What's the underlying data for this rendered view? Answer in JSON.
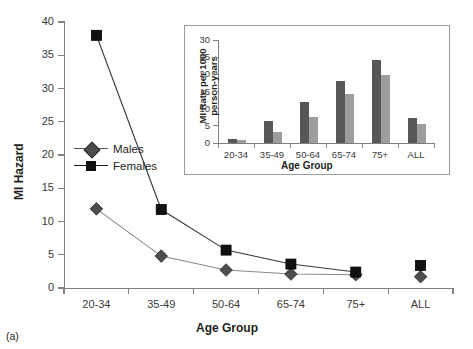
{
  "panel_label": "(a)",
  "legend": {
    "items": [
      {
        "label": "Males",
        "marker": "diamond-marker",
        "color": "#4d4d4d"
      },
      {
        "label": "Females",
        "marker": "square-marker",
        "color": "#111111"
      }
    ]
  },
  "chart_data": [
    {
      "type": "line",
      "name": "main-line-chart",
      "title": "",
      "xlabel": "Age Group",
      "ylabel": "MI Hazard",
      "categories": [
        "20-34",
        "35-49",
        "50-64",
        "65-74",
        "75+",
        "ALL"
      ],
      "yticks": [
        0,
        5,
        10,
        15,
        20,
        25,
        30,
        35,
        40
      ],
      "ylim": [
        0,
        40
      ],
      "grid": false,
      "legend_position": "inside-left",
      "note": "ALL category markers are plotted detached from the connecting line",
      "series": [
        {
          "name": "Males",
          "color": "#4d4d4d",
          "marker": "diamond",
          "values": [
            11.9,
            4.8,
            2.7,
            2.1,
            2.0,
            1.7
          ]
        },
        {
          "name": "Females",
          "color": "#111111",
          "marker": "square",
          "values": [
            38.0,
            11.8,
            5.7,
            3.6,
            2.4,
            3.4
          ]
        }
      ]
    },
    {
      "type": "bar",
      "name": "inset-bar-chart",
      "title": "",
      "xlabel": "Age Group",
      "ylabel": "MI Rate per 1000 person-years",
      "categories": [
        "20-34",
        "35-49",
        "50-64",
        "65-74",
        "75+",
        "ALL"
      ],
      "yticks": [
        0,
        5,
        10,
        15,
        20,
        25,
        30
      ],
      "ylim": [
        0,
        30
      ],
      "grid": false,
      "series": [
        {
          "name": "Males",
          "color": "#575757",
          "values": [
            1.3,
            6.3,
            11.9,
            18.0,
            24.2,
            7.3
          ]
        },
        {
          "name": "Females",
          "color": "#9d9d9d",
          "values": [
            0.8,
            3.3,
            7.5,
            14.3,
            19.9,
            5.5
          ]
        }
      ]
    }
  ]
}
